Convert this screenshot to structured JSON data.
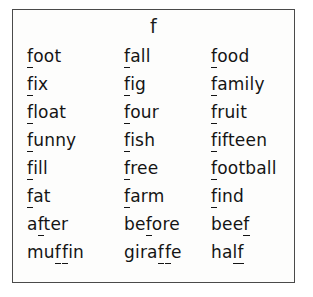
{
  "card": {
    "header_letter": "f",
    "border_color": "#4a4a4a",
    "background_color": "#fdfdfc",
    "text_color": "#141414"
  },
  "grid": {
    "rows": 8,
    "columns": 3,
    "cells": [
      {
        "id": "r1c1",
        "prefix": "",
        "marked": "f",
        "gap": "",
        "marked2": "",
        "suffix": "oot",
        "word": "foot"
      },
      {
        "id": "r1c2",
        "prefix": "",
        "marked": "f",
        "gap": "",
        "marked2": "",
        "suffix": "all",
        "word": "fall"
      },
      {
        "id": "r1c3",
        "prefix": "",
        "marked": "f",
        "gap": "",
        "marked2": "",
        "suffix": "ood",
        "word": "food"
      },
      {
        "id": "r2c1",
        "prefix": "",
        "marked": "f",
        "gap": "",
        "marked2": "",
        "suffix": "ix",
        "word": "fix"
      },
      {
        "id": "r2c2",
        "prefix": "",
        "marked": "f",
        "gap": "",
        "marked2": "",
        "suffix": "ig",
        "word": "fig"
      },
      {
        "id": "r2c3",
        "prefix": "",
        "marked": "f",
        "gap": "",
        "marked2": "",
        "suffix": "amily",
        "word": "family"
      },
      {
        "id": "r3c1",
        "prefix": "",
        "marked": "f",
        "gap": "",
        "marked2": "",
        "suffix": "loat",
        "word": "float"
      },
      {
        "id": "r3c2",
        "prefix": "",
        "marked": "f",
        "gap": "",
        "marked2": "",
        "suffix": "our",
        "word": "four"
      },
      {
        "id": "r3c3",
        "prefix": "",
        "marked": "f",
        "gap": "",
        "marked2": "",
        "suffix": "ruit",
        "word": "fruit"
      },
      {
        "id": "r4c1",
        "prefix": "",
        "marked": "f",
        "gap": "",
        "marked2": "",
        "suffix": "unny",
        "word": "funny"
      },
      {
        "id": "r4c2",
        "prefix": "",
        "marked": "f",
        "gap": "",
        "marked2": "",
        "suffix": "ish",
        "word": "fish"
      },
      {
        "id": "r4c3",
        "prefix": "",
        "marked": "f",
        "gap": "",
        "marked2": "",
        "suffix": "ifteen",
        "word": "fifteen"
      },
      {
        "id": "r5c1",
        "prefix": "",
        "marked": "f",
        "gap": "",
        "marked2": "",
        "suffix": "ill",
        "word": "fill"
      },
      {
        "id": "r5c2",
        "prefix": "",
        "marked": "f",
        "gap": "",
        "marked2": "",
        "suffix": "ree",
        "word": "free"
      },
      {
        "id": "r5c3",
        "prefix": "",
        "marked": "f",
        "gap": "",
        "marked2": "",
        "suffix": "ootball",
        "word": "football"
      },
      {
        "id": "r6c1",
        "prefix": "",
        "marked": "f",
        "gap": "",
        "marked2": "",
        "suffix": "at",
        "word": "fat"
      },
      {
        "id": "r6c2",
        "prefix": "",
        "marked": "f",
        "gap": "",
        "marked2": "",
        "suffix": "arm",
        "word": "farm"
      },
      {
        "id": "r6c3",
        "prefix": "",
        "marked": "f",
        "gap": "",
        "marked2": "",
        "suffix": "ind",
        "word": "find"
      },
      {
        "id": "r7c1",
        "prefix": "a",
        "marked": "f",
        "gap": "",
        "marked2": "",
        "suffix": "ter",
        "word": "after"
      },
      {
        "id": "r7c2",
        "prefix": "be",
        "marked": "f",
        "gap": "",
        "marked2": "",
        "suffix": "ore",
        "word": "before"
      },
      {
        "id": "r7c3",
        "prefix": "bee",
        "marked": "f",
        "gap": "",
        "marked2": "",
        "suffix": "",
        "word": "beef"
      },
      {
        "id": "r8c1",
        "prefix": "mu",
        "marked": "f",
        "gap": "",
        "marked2": "f",
        "suffix": "in",
        "word": "muffin"
      },
      {
        "id": "r8c2",
        "prefix": "gira",
        "marked": "f",
        "gap": "",
        "marked2": "f",
        "suffix": "e",
        "word": "giraffe"
      },
      {
        "id": "r8c3",
        "prefix": "ha",
        "marked": "lf",
        "gap": "",
        "marked2": "",
        "suffix": "",
        "word": "half"
      }
    ]
  }
}
